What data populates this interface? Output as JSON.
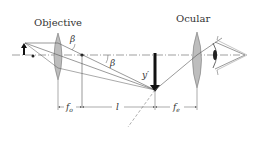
{
  "diagram": {
    "labels": {
      "objective": "Objective",
      "ocular": "Ocular",
      "beta_top": "β",
      "beta_mid": "β",
      "image": "y′",
      "f_o_main": "f",
      "f_o_sub": "o",
      "l": "l",
      "f_e_main": "f",
      "f_e_sub": "e"
    },
    "colors": {
      "line": "#555555",
      "lens_fill": "#bdbdbd",
      "image_arrow": "#111111"
    }
  }
}
